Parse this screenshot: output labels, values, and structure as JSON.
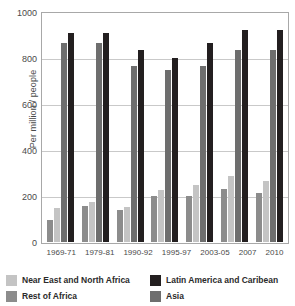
{
  "chart_data": {
    "type": "bar",
    "title": "",
    "xlabel": "",
    "ylabel": "Per million / people",
    "ylim": [
      0,
      1000
    ],
    "yticks": [
      0,
      200,
      400,
      600,
      800,
      1000
    ],
    "grid": true,
    "legend_position": "bottom",
    "categories": [
      "1969-71",
      "1979-81",
      "1990-92",
      "1995-97",
      "2003-05",
      "2007",
      "2010"
    ],
    "series": [
      {
        "name": "Rest of Africa",
        "color": "#8c8c8c",
        "values": [
          95,
          157,
          140,
          200,
          200,
          230,
          213
        ]
      },
      {
        "name": "Near East and North Africa",
        "color": "#c4c4c4",
        "values": [
          150,
          175,
          152,
          225,
          250,
          285,
          265
        ]
      },
      {
        "name": "Asia",
        "color": "#6e6e6e",
        "values": [
          865,
          865,
          765,
          750,
          765,
          835,
          833
        ]
      },
      {
        "name": "Latin America and Caribean",
        "color": "#231f20",
        "values": [
          910,
          910,
          835,
          800,
          865,
          920,
          920
        ]
      }
    ],
    "legend_entries": [
      {
        "label": "Near East and North Africa",
        "color": "#c4c4c4"
      },
      {
        "label": "Latin America and Caribean",
        "color": "#231f20"
      },
      {
        "label": "Rest of Africa",
        "color": "#8c8c8c"
      },
      {
        "label": "Asia",
        "color": "#6e6e6e"
      }
    ]
  }
}
